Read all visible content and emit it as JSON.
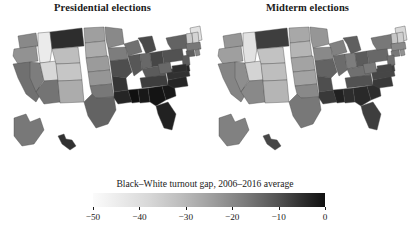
{
  "figure": {
    "background": "#ffffff",
    "panels": [
      {
        "title": "Presidential elections"
      },
      {
        "title": "Midterm elections"
      }
    ]
  },
  "legend": {
    "title": "Black–White turnout gap, 2006–2016 average",
    "ticks": [
      "−50",
      "−40",
      "−30",
      "−20",
      "−10",
      "0"
    ],
    "min": -55,
    "max": 0,
    "low_color": "#fbfbfb",
    "high_color": "#111111"
  },
  "chart_data": {
    "type": "heatmap",
    "subtype": "choropleth-map",
    "title": "",
    "xlabel": "",
    "ylabel": "",
    "colorbar_label": "Black–White turnout gap, 2006–2016 average",
    "colorbar_ticks": [
      -50,
      -40,
      -30,
      -20,
      -10,
      0
    ],
    "value_range": [
      -55,
      0
    ],
    "colormap": "grayscale-light-to-dark",
    "legend_position": "bottom-center",
    "grid": false,
    "units": "percentage points",
    "panels": [
      {
        "name": "Presidential elections",
        "values": {
          "AL": -3,
          "AK": -26,
          "AZ": -25,
          "AR": -10,
          "CA": -24,
          "CO": -44,
          "CT": -20,
          "DE": -6,
          "FL": -5,
          "GA": -2,
          "HI": -9,
          "ID": -52,
          "IL": -18,
          "IN": -22,
          "IA": -27,
          "KS": -33,
          "KY": -19,
          "LA": -6,
          "ME": -50,
          "MD": -8,
          "MA": -26,
          "MI": -15,
          "MN": -30,
          "MS": -1,
          "MO": -16,
          "MT": -8,
          "NE": -34,
          "NV": -27,
          "NH": -47,
          "NJ": -19,
          "NM": -38,
          "NY": -21,
          "NC": -6,
          "ND": -35,
          "OH": -14,
          "OK": -26,
          "OR": -32,
          "PA": -17,
          "RI": -29,
          "SC": -3,
          "SD": -38,
          "TN": -12,
          "TX": -21,
          "UT": -48,
          "VT": -45,
          "VA": -9,
          "WA": -30,
          "WV": -22,
          "WI": -24,
          "WY": -42
        }
      },
      {
        "name": "Midterm elections",
        "values": {
          "AL": -8,
          "AK": -28,
          "AZ": -30,
          "AR": -16,
          "CA": -29,
          "CO": -42,
          "CT": -26,
          "DE": -12,
          "FL": -12,
          "GA": -7,
          "HI": -14,
          "ID": -50,
          "IL": -23,
          "IN": -27,
          "IA": -30,
          "KS": -36,
          "KY": -24,
          "LA": -11,
          "ME": -48,
          "MD": -14,
          "MA": -30,
          "MI": -20,
          "MN": -33,
          "MS": -5,
          "MO": -21,
          "MT": -12,
          "NE": -36,
          "NV": -31,
          "NH": -46,
          "NJ": -24,
          "NM": -40,
          "NY": -26,
          "NC": -11,
          "ND": -37,
          "OH": -19,
          "OK": -30,
          "OR": -35,
          "PA": -22,
          "RI": -32,
          "SC": -8,
          "SD": -40,
          "TN": -17,
          "TX": -26,
          "UT": -47,
          "VT": -44,
          "VA": -14,
          "WA": -33,
          "WV": -26,
          "WI": -28,
          "WY": -43
        }
      }
    ]
  }
}
